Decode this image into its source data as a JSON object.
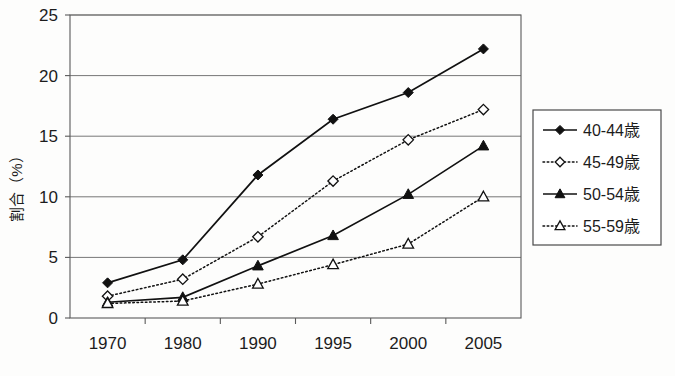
{
  "chart_data": {
    "type": "line",
    "title": "",
    "subtitle": "",
    "xlabel": "",
    "ylabel": "割合（%）",
    "categories": [
      "1970",
      "1980",
      "1990",
      "1995",
      "2000",
      "2005"
    ],
    "ylim": [
      0,
      25
    ],
    "yticks": [
      0,
      5,
      10,
      15,
      20,
      25
    ],
    "ytick_labels": [
      "0",
      "5",
      "10",
      "15",
      "20",
      "25"
    ],
    "grid": "horizontal",
    "legend_position": "right",
    "series": [
      {
        "name": "40-44歳",
        "marker": "filled-diamond",
        "line_style": "solid",
        "color": "#111111",
        "values": [
          2.9,
          4.8,
          11.8,
          16.4,
          18.6,
          22.2
        ]
      },
      {
        "name": "45-49歳",
        "marker": "open-diamond",
        "line_style": "dotted",
        "color": "#111111",
        "values": [
          1.8,
          3.2,
          6.7,
          11.3,
          14.7,
          17.2
        ]
      },
      {
        "name": "50-54歳",
        "marker": "filled-triangle",
        "line_style": "solid",
        "color": "#111111",
        "values": [
          1.3,
          1.7,
          4.3,
          6.8,
          10.2,
          14.2
        ]
      },
      {
        "name": "55-59歳",
        "marker": "open-triangle",
        "line_style": "dotted",
        "color": "#111111",
        "values": [
          1.2,
          1.4,
          2.8,
          4.4,
          6.1,
          10.0
        ]
      }
    ]
  },
  "legend": {
    "entries": [
      {
        "label": "40-44歳"
      },
      {
        "label": "45-49歳"
      },
      {
        "label": "50-54歳"
      },
      {
        "label": "55-59歳"
      }
    ]
  },
  "axes": {
    "y_axis_title": "割合（%）",
    "y_tick_labels": [
      "25",
      "20",
      "15",
      "10",
      "5",
      "0"
    ],
    "x_tick_labels": [
      "1970",
      "1980",
      "1990",
      "1995",
      "2000",
      "2005"
    ]
  }
}
